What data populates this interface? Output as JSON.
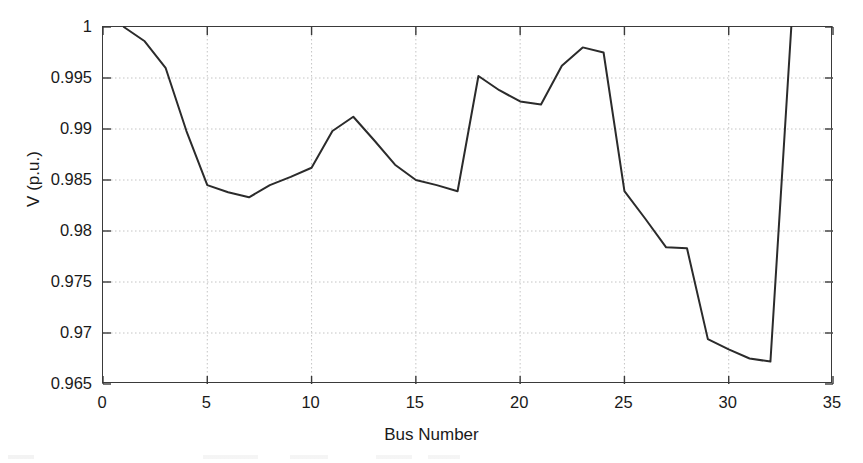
{
  "chart_data": {
    "type": "line",
    "title": "",
    "subtitle": "",
    "xlabel": "Bus Number",
    "ylabel": "V (p.u.)",
    "xlim": [
      0,
      35
    ],
    "ylim": [
      0.965,
      1
    ],
    "xticks": [
      0,
      5,
      10,
      15,
      20,
      25,
      30,
      35
    ],
    "xtick_labels": [
      "0",
      "5",
      "10",
      "15",
      "20",
      "25",
      "30",
      "35"
    ],
    "yticks": [
      0.965,
      0.97,
      0.975,
      0.98,
      0.985,
      0.99,
      0.995,
      1
    ],
    "ytick_labels": [
      "0.965",
      "0.97",
      "0.975",
      "0.98",
      "0.985",
      "0.99",
      "0.995",
      "1"
    ],
    "grid": true,
    "grid_color": "#bdbdbd",
    "legend": null,
    "legend_position": "none",
    "line_color": "#2b2b2b",
    "line_width": 2.0,
    "series": [
      {
        "name": "V (p.u.)",
        "x": [
          1,
          2,
          3,
          4,
          5,
          6,
          7,
          8,
          9,
          10,
          11,
          12,
          13,
          14,
          15,
          16,
          17,
          18,
          19,
          20,
          21,
          22,
          23,
          24,
          25,
          26,
          27,
          28,
          29,
          30,
          31,
          32,
          33
        ],
        "values": [
          1.0,
          0.9986,
          0.996,
          0.9898,
          0.9845,
          0.9838,
          0.9833,
          0.9845,
          0.9853,
          0.9862,
          0.9898,
          0.9912,
          0.9889,
          0.9865,
          0.985,
          0.9845,
          0.9839,
          0.9952,
          0.9938,
          0.9927,
          0.9924,
          0.9962,
          0.998,
          0.9975,
          0.9839,
          0.9812,
          0.9784,
          0.9783,
          0.9694,
          0.9684,
          0.9675,
          0.9672,
          1.0
        ]
      }
    ]
  }
}
